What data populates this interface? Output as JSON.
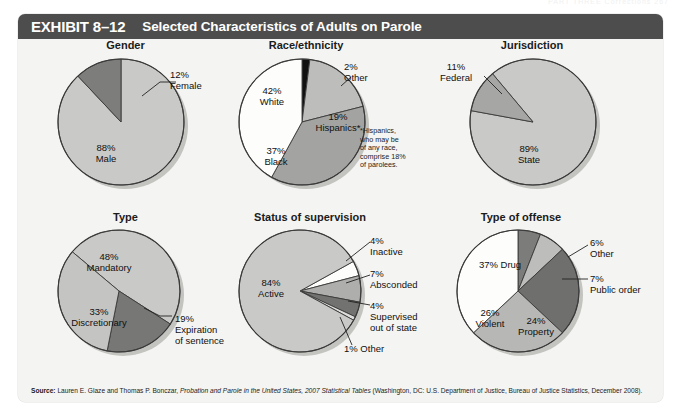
{
  "running_header": {
    "text": "PART THREE   Corrections   267"
  },
  "exhibit": {
    "number_label": "EXHIBIT 8–12",
    "title": "Selected Characteristics of Adults on Parole"
  },
  "colors": {
    "header_bar": "#4d4d4d",
    "panel_bg": "#f4f4f2",
    "page_bg": "#ffffff",
    "slice_white": "#fdfdfb",
    "slice_light": "#c9c9c7",
    "slice_medium_light": "#b4b4b2",
    "slice_medium": "#a0a09e",
    "slice_dark": "#777775",
    "slice_darker": "#6a6a68",
    "slice_black": "#111111",
    "outline": "#3a3a3a",
    "text": "#101010"
  },
  "source": {
    "label": "Source:",
    "text_before_italic": " Lauren E. Glaze and Thomas P. Bonczar, ",
    "italic_text": "Probation and Parole in the United States, 2007 Statistical Tables",
    "text_after_italic": " (Washington, DC: U.S. Department of Justice, Bureau of Justice Statistics, December 2008)."
  },
  "chart_data": [
    {
      "type": "pie",
      "title": "Gender",
      "categories": [
        "Male",
        "Female"
      ],
      "values": [
        88,
        12
      ],
      "labels": [
        "88%\nMale",
        "12%\nFemale"
      ],
      "colors": [
        "#c9c9c7",
        "#7d7d7b"
      ],
      "start_angle": 0,
      "legend": "inside-and-callout"
    },
    {
      "type": "pie",
      "title": "Race/ethnicity",
      "categories": [
        "Other",
        "Hispanics*",
        "Black",
        "White"
      ],
      "values": [
        2,
        19,
        37,
        42
      ],
      "labels": [
        "2%\nOther",
        "19%\nHispanics*",
        "37%\nBlack",
        "42%\nWhite"
      ],
      "colors": [
        "#111111",
        "#bdbdbb",
        "#a3a3a1",
        "#fdfdfb"
      ],
      "start_angle": 0,
      "footnote": "*Hispanics,\nwho may be\nof any race,\ncomprise 18%\nof parolees.",
      "legend": "inside-and-callout"
    },
    {
      "type": "pie",
      "title": "Jurisdiction",
      "categories": [
        "State",
        "Federal"
      ],
      "values": [
        89,
        11
      ],
      "labels": [
        "89%\nState",
        "11%\nFederal"
      ],
      "colors": [
        "#c9c9c7",
        "#a6a6a4"
      ],
      "start_angle": -40,
      "legend": "inside-and-callout"
    },
    {
      "type": "pie",
      "title": "Type",
      "categories": [
        "Mandatory",
        "Expiration of sentence",
        "Discretionary"
      ],
      "values": [
        48,
        19,
        33
      ],
      "labels": [
        "48%\nMandatory",
        "19%\nExpiration\nof sentence",
        "33%\nDiscretionary"
      ],
      "colors": [
        "#c9c9c7",
        "#777775",
        "#c4c4c2"
      ],
      "start_angle": -50,
      "legend": "inside-and-callout"
    },
    {
      "type": "pie",
      "title": "Status of supervision",
      "categories": [
        "Inactive",
        "Absconded",
        "Supervised out of state",
        "Other",
        "Active"
      ],
      "values": [
        4,
        7,
        4,
        1,
        84
      ],
      "labels": [
        "4%\nInactive",
        "7%\nAbsconded",
        "4%\nSupervised\nout of state",
        "1% Other",
        "84%\nActive"
      ],
      "colors": [
        "#fdfdfb",
        "#aeaeac",
        "#727270",
        "#dcdcda",
        "#c9c9c7"
      ],
      "start_angle": 61,
      "legend": "inside-and-callout"
    },
    {
      "type": "pie",
      "title": "Type of offense",
      "categories": [
        "Other",
        "Public order",
        "Property",
        "Violent",
        "Drug"
      ],
      "values": [
        6,
        7,
        24,
        26,
        37
      ],
      "labels": [
        "6%\nOther",
        "7%\nPublic order",
        "24%\nProperty",
        "26%\nViolent",
        "37% Drug"
      ],
      "colors": [
        "#7c7c7a",
        "#bdbdbb",
        "#6f6f6d",
        "#b7b7b5",
        "#fdfdfb"
      ],
      "start_angle": 0,
      "legend": "inside-and-callout"
    }
  ]
}
